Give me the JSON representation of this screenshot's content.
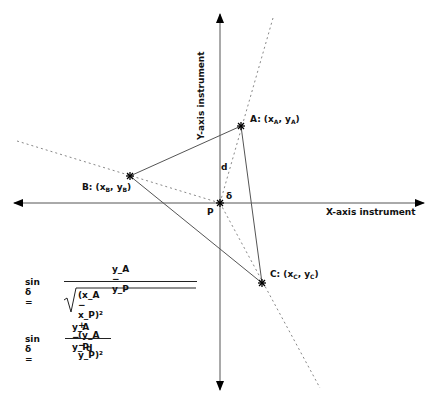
{
  "diagram": {
    "axes": {
      "x_label": "X-axis instrument",
      "y_label": "Y-axis instrument"
    },
    "points": {
      "A": {
        "label": "A: (x",
        "sub1": "A",
        "mid": ", y",
        "sub2": "A",
        "end": ")"
      },
      "B": {
        "label": "B: (x",
        "sub1": "B",
        "mid": ", y",
        "sub2": "B",
        "end": ")"
      },
      "C": {
        "label": "C: (x",
        "sub1": "C",
        "mid": ", y",
        "sub2": "C",
        "end": ")"
      },
      "P": {
        "label": "P"
      }
    },
    "distance_label": "d",
    "angle_label": "δ",
    "colors": {
      "line": "#555555",
      "dashed": "#888888",
      "marker": "#000000"
    }
  },
  "formulas": {
    "f1": {
      "lhs": "sin δ =",
      "numerator": "y_A − y_P",
      "denominator": "(x_A − x_P)² + (y_A − y_P)²"
    },
    "f2": {
      "lhs": "sin δ =",
      "numerator": "y_A − y_P",
      "denominator": "d"
    }
  }
}
